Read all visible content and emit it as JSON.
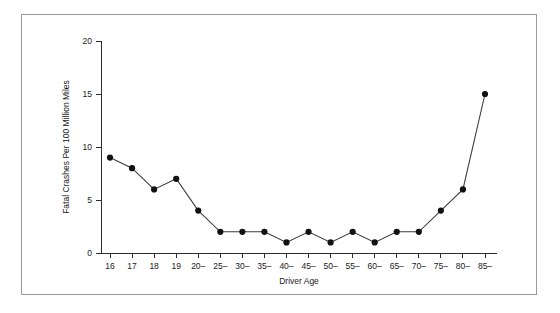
{
  "chart_data": {
    "type": "line",
    "title": "",
    "xlabel": "Driver Age",
    "ylabel": "Fatal Crashes Per 100 Million Miles",
    "categories": [
      "16",
      "17",
      "18",
      "19",
      "20–",
      "25–",
      "30–",
      "35–",
      "40–",
      "45–",
      "50–",
      "55–",
      "60–",
      "65–",
      "70–",
      "75–",
      "80–",
      "85–"
    ],
    "values": [
      9,
      8,
      6,
      7,
      4,
      2,
      2,
      2,
      1,
      2,
      1,
      2,
      1,
      2,
      2,
      4,
      6,
      15
    ],
    "ylim": [
      0,
      20
    ],
    "yticks": [
      0,
      5,
      10,
      15,
      20
    ],
    "ytick_labels": [
      "0",
      "5",
      "10",
      "15",
      "20"
    ],
    "grid": false,
    "legend": false,
    "marker": "filled-circle",
    "line_color": "#3d3d3d",
    "marker_color": "#111111",
    "background_color": "#ffffff",
    "frame_color": "#9a9a9a"
  }
}
